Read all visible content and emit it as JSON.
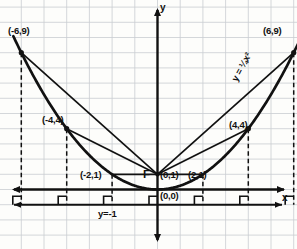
{
  "figure": {
    "axis_labels": {
      "x": "x",
      "y": "y"
    },
    "focus_marker": "F",
    "equation_label": "y = ¼x²",
    "directrix_label": "y=-1",
    "point_labels": [
      {
        "name": "vertex",
        "text": "(0,0)"
      },
      {
        "name": "focus",
        "text": "(0,1)"
      },
      {
        "name": "left-2",
        "text": "(-2,1)"
      },
      {
        "name": "right-2",
        "text": "(2,1)"
      },
      {
        "name": "left-4",
        "text": "(-4,4)"
      },
      {
        "name": "right-4",
        "text": "(4,4)"
      },
      {
        "name": "left-6",
        "text": "(-6,9)"
      },
      {
        "name": "right-6",
        "text": "(6,9)"
      }
    ],
    "colors": {
      "ink": "#111111",
      "grid": "#c9cdd2",
      "paper": "#fdfdfb"
    }
  },
  "chart_data": {
    "type": "line",
    "title": "y = ¼x²",
    "xlabel": "x",
    "ylabel": "y",
    "xlim": [
      -7,
      7
    ],
    "ylim": [
      -2,
      10
    ],
    "grid": true,
    "legend": "none",
    "curve": {
      "name": "parabola",
      "equation": "y = ¼x²",
      "x": [
        -6.3,
        -6,
        -5,
        -4,
        -3,
        -2,
        -1,
        0,
        1,
        2,
        3,
        4,
        5,
        6,
        6.3
      ],
      "y": [
        9.92,
        9,
        6.25,
        4,
        2.25,
        1,
        0.25,
        0,
        0.25,
        1,
        2.25,
        4,
        6.25,
        9,
        9.92
      ]
    },
    "focus": {
      "label": "F",
      "x": 0,
      "y": 1
    },
    "directrix": {
      "label": "y=-1",
      "y": -1
    },
    "marked_points": [
      {
        "label": "(0,0)",
        "x": 0,
        "y": 0
      },
      {
        "label": "(-2,1)",
        "x": -2,
        "y": 1
      },
      {
        "label": "(2,1)",
        "x": 2,
        "y": 1
      },
      {
        "label": "(-4,4)",
        "x": -4,
        "y": 4
      },
      {
        "label": "(4,4)",
        "x": 4,
        "y": 4
      },
      {
        "label": "(-6,9)",
        "x": -6,
        "y": 9
      },
      {
        "label": "(6,9)",
        "x": 6,
        "y": 9
      }
    ],
    "focal_radii": [
      {
        "from": [
          0,
          1
        ],
        "to": [
          -2,
          1
        ]
      },
      {
        "from": [
          0,
          1
        ],
        "to": [
          2,
          1
        ]
      },
      {
        "from": [
          0,
          1
        ],
        "to": [
          -4,
          4
        ]
      },
      {
        "from": [
          0,
          1
        ],
        "to": [
          4,
          4
        ]
      },
      {
        "from": [
          0,
          1
        ],
        "to": [
          -6,
          9
        ]
      },
      {
        "from": [
          0,
          1
        ],
        "to": [
          6,
          9
        ]
      }
    ],
    "perpendiculars": [
      {
        "x": -6,
        "from_y": 9,
        "to_y": -1
      },
      {
        "x": -4,
        "from_y": 4,
        "to_y": -1
      },
      {
        "x": -2,
        "from_y": 1,
        "to_y": -1
      },
      {
        "x": 0,
        "from_y": 1,
        "to_y": -1
      },
      {
        "x": 2,
        "from_y": 1,
        "to_y": -1
      },
      {
        "x": 4,
        "from_y": 4,
        "to_y": -1
      },
      {
        "x": 6,
        "from_y": 9,
        "to_y": -1
      }
    ]
  }
}
